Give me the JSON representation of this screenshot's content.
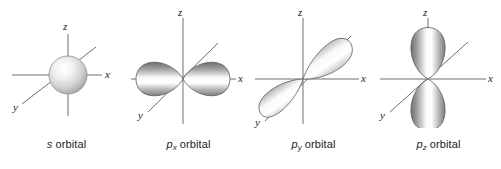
{
  "figure": {
    "background_color": "#ffffff",
    "axis_color": "#6e6e6e",
    "label_color": "#1c1c1c",
    "lobe_edge_color": "#59595b",
    "lobe_dark_color": "#77777a",
    "lobe_light_color": "#ffffff"
  },
  "panels": [
    {
      "id": "s-orbital",
      "caption_symbol": "s",
      "caption_subscript": "",
      "caption_word": " orbital",
      "shape": "sphere",
      "axes": {
        "x": "x",
        "y": "y",
        "z": "z"
      }
    },
    {
      "id": "px-orbital",
      "caption_symbol": "p",
      "caption_subscript": "x",
      "caption_word": " orbital",
      "shape": "two-lobes-horizontal",
      "axes": {
        "x": "x",
        "y": "y",
        "z": "z"
      }
    },
    {
      "id": "py-orbital",
      "caption_symbol": "p",
      "caption_subscript": "y",
      "caption_word": " orbital",
      "shape": "two-lobes-diagonal",
      "axes": {
        "x": "x",
        "y": "y",
        "z": "z"
      }
    },
    {
      "id": "pz-orbital",
      "caption_symbol": "p",
      "caption_subscript": "z",
      "caption_word": " orbital",
      "shape": "two-lobes-vertical",
      "axes": {
        "x": "x",
        "y": "y",
        "z": "z"
      }
    }
  ]
}
